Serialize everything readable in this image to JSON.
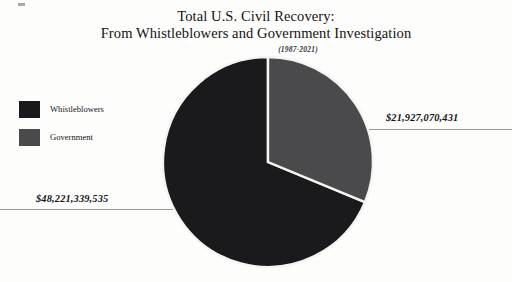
{
  "chart_data": {
    "type": "pie",
    "title": "Total U.S. Civil Recovery:",
    "title_line2": "From Whistleblowers and Government Investigation",
    "subtitle": "(1987-2021)",
    "xlabel": "",
    "ylabel": "",
    "legend_position": "left",
    "grid": false,
    "start_angle_deg": 0,
    "direction": "clockwise",
    "categories": [
      "Whistleblowers",
      "Government"
    ],
    "values": [
      48221339535,
      21927070431
    ],
    "value_labels": [
      "$48,221,339,535",
      "$21,927,070,431"
    ],
    "percentages": [
      68.74,
      31.26
    ],
    "total": 70148409966,
    "colors": [
      "#1a1a1c",
      "#4a4a4c"
    ],
    "slices": [
      {
        "label": "Whistleblowers",
        "value": 48221339535,
        "value_label": "$48,221,339,535",
        "percent": 68.74,
        "color": "#1a1a1c"
      },
      {
        "label": "Government",
        "value": 21927070431,
        "value_label": "$21,927,070,431",
        "percent": 31.26,
        "color": "#4a4a4c"
      }
    ]
  },
  "legend": {
    "items": [
      {
        "label": "Whistleblowers",
        "color": "#1a1a1c"
      },
      {
        "label": "Government",
        "color": "#4a4a4c"
      }
    ]
  },
  "callouts": {
    "government": "$21,927,070,431",
    "whistleblowers": "$48,221,339,535"
  },
  "style": {
    "background": "#fdfdfc",
    "leader_line_color": "#9a9a9e",
    "slice_border": "#f4f4f2"
  }
}
